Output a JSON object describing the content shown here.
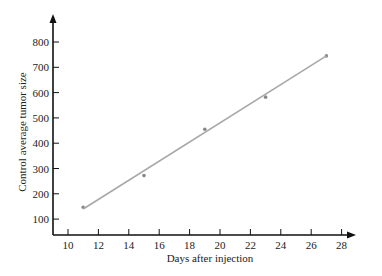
{
  "chart_data": {
    "type": "scatter",
    "title": "",
    "xlabel": "Days after injection",
    "ylabel": "Control average tumor size",
    "x_ticks": [
      10,
      12,
      14,
      16,
      18,
      20,
      22,
      24,
      26,
      28
    ],
    "y_ticks": [
      100,
      200,
      300,
      400,
      500,
      600,
      700,
      800
    ],
    "xlim": [
      9,
      29
    ],
    "ylim": [
      45,
      880
    ],
    "grid": false,
    "legend": null,
    "series": [
      {
        "name": "Observed",
        "type": "scatter",
        "x": [
          11,
          15,
          19,
          23,
          27
        ],
        "y": [
          147,
          272,
          455,
          582,
          745
        ]
      },
      {
        "name": "Fitted line",
        "type": "line",
        "x": [
          11,
          27
        ],
        "y": [
          140,
          745
        ]
      }
    ],
    "colors": {
      "axis": "#111111",
      "fit_line": "#a8a8a8",
      "points": "#888888"
    }
  }
}
